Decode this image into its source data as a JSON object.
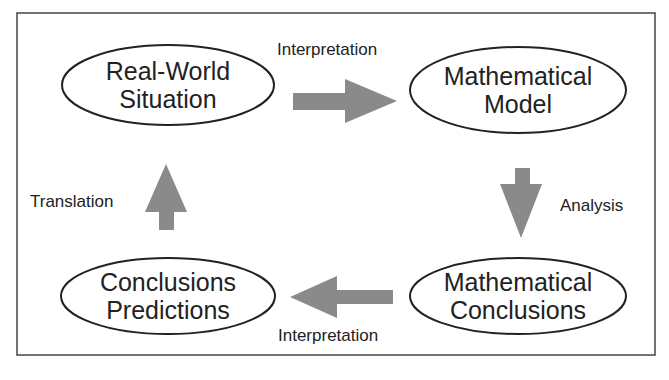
{
  "diagram": {
    "nodes": [
      {
        "id": "real-world",
        "lines": [
          "Real-World",
          "Situation"
        ]
      },
      {
        "id": "math-model",
        "lines": [
          "Mathematical",
          "Model"
        ]
      },
      {
        "id": "conclusions-predictions",
        "lines": [
          "Conclusions",
          "Predictions"
        ]
      },
      {
        "id": "math-conclusions",
        "lines": [
          "Mathematical",
          "Conclusions"
        ]
      }
    ],
    "edges": [
      {
        "from": "real-world",
        "to": "math-model",
        "label": "Interpretation"
      },
      {
        "from": "math-model",
        "to": "math-conclusions",
        "label": "Analysis"
      },
      {
        "from": "math-conclusions",
        "to": "conclusions-predictions",
        "label": "Interpretation"
      },
      {
        "from": "conclusions-predictions",
        "to": "real-world",
        "label": "Translation"
      }
    ],
    "colors": {
      "arrow": "#8a8a8a",
      "stroke": "#222222",
      "frame": "#444444"
    }
  }
}
